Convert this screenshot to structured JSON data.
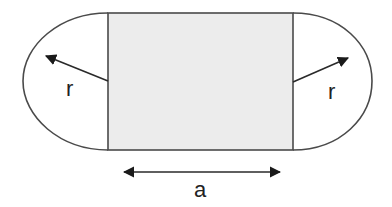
{
  "diagram": {
    "type": "stadium-shape",
    "colors": {
      "outline": "#4a4a4a",
      "rect_fill": "#ececec",
      "cap_fill": "#ffffff",
      "text": "#222222"
    },
    "labels": {
      "left_radius": "r",
      "right_radius": "r",
      "width": "a"
    }
  }
}
